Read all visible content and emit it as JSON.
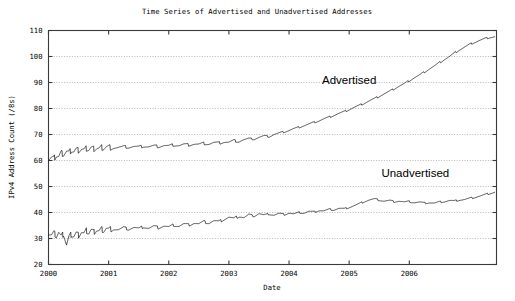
{
  "chart_data": {
    "type": "line",
    "title": "Time Series of Advertised and Unadvertised Addresses",
    "xlabel": "Date",
    "ylabel": "IPv4 Address Count (/8s)",
    "xlim": [
      2000.0,
      2007.45
    ],
    "ylim": [
      20,
      110
    ],
    "xticks": [
      2000,
      2001,
      2002,
      2003,
      2004,
      2005,
      2006
    ],
    "xtick_labels": [
      "2000",
      "2001",
      "2002",
      "2003",
      "2004",
      "2005",
      "2006"
    ],
    "yticks": [
      20,
      30,
      40,
      50,
      60,
      70,
      80,
      90,
      100,
      110
    ],
    "ytick_labels": [
      "20",
      "30",
      "40",
      "50",
      "60",
      "70",
      "80",
      "90",
      "100",
      "110"
    ],
    "grid": true,
    "grid_axis": "y",
    "legend": "none",
    "annotations": [
      {
        "text": "Advertised",
        "x": 2005.0,
        "y": 89.5
      },
      {
        "text": "Unadvertised",
        "x": 2006.1,
        "y": 53.5
      }
    ],
    "series": [
      {
        "name": "Advertised",
        "x": [
          2000.0,
          2000.05,
          2000.09,
          2000.13,
          2000.17,
          2000.21,
          2000.25,
          2000.3,
          2000.34,
          2000.38,
          2000.42,
          2000.46,
          2000.5,
          2000.55,
          2000.59,
          2000.63,
          2000.67,
          2000.71,
          2000.75,
          2000.8,
          2000.84,
          2000.88,
          2000.92,
          2000.96,
          2001.0,
          2001.08,
          2001.17,
          2001.25,
          2001.33,
          2001.42,
          2001.5,
          2001.58,
          2001.67,
          2001.75,
          2001.83,
          2001.92,
          2002.0,
          2002.08,
          2002.17,
          2002.25,
          2002.33,
          2002.42,
          2002.5,
          2002.58,
          2002.67,
          2002.75,
          2002.83,
          2002.92,
          2003.0,
          2003.08,
          2003.17,
          2003.25,
          2003.33,
          2003.42,
          2003.5,
          2003.58,
          2003.67,
          2003.75,
          2003.83,
          2003.92,
          2004.0,
          2004.08,
          2004.17,
          2004.25,
          2004.33,
          2004.42,
          2004.5,
          2004.58,
          2004.67,
          2004.75,
          2004.83,
          2004.92,
          2005.0,
          2005.08,
          2005.17,
          2005.25,
          2005.33,
          2005.42,
          2005.5,
          2005.58,
          2005.67,
          2005.75,
          2005.83,
          2005.92,
          2006.0,
          2006.08,
          2006.17,
          2006.25,
          2006.33,
          2006.42,
          2006.5,
          2006.58,
          2006.67,
          2006.75,
          2006.83,
          2006.92,
          2007.0,
          2007.08,
          2007.17,
          2007.25,
          2007.33,
          2007.42
        ],
        "y": [
          60.5,
          61.2,
          60.8,
          62.0,
          61.5,
          63.0,
          62.4,
          63.6,
          63.0,
          64.0,
          63.4,
          64.2,
          63.8,
          64.5,
          64.0,
          64.6,
          64.2,
          64.8,
          64.4,
          64.9,
          64.5,
          65.0,
          64.7,
          65.1,
          64.9,
          65.2,
          65.0,
          65.3,
          65.1,
          65.4,
          65.2,
          65.5,
          65.3,
          65.6,
          65.4,
          65.8,
          65.6,
          66.0,
          65.8,
          66.2,
          66.0,
          66.4,
          66.2,
          66.6,
          66.4,
          66.9,
          66.7,
          67.2,
          67.0,
          67.6,
          67.4,
          68.0,
          68.4,
          68.2,
          68.9,
          69.4,
          69.2,
          70.0,
          70.5,
          71.0,
          71.6,
          72.2,
          72.8,
          73.4,
          74.0,
          74.7,
          75.3,
          76.0,
          76.7,
          77.4,
          78.1,
          78.8,
          79.6,
          80.4,
          81.2,
          82.0,
          82.9,
          83.8,
          84.7,
          85.6,
          86.6,
          87.6,
          88.6,
          89.6,
          90.7,
          91.8,
          92.9,
          94.0,
          95.2,
          96.4,
          97.6,
          98.8,
          100.0,
          101.3,
          102.5,
          103.6,
          104.6,
          105.4,
          106.2,
          106.8,
          107.3,
          107.6
        ]
      },
      {
        "name": "Unadvertised",
        "x": [
          2000.0,
          2000.05,
          2000.09,
          2000.13,
          2000.17,
          2000.21,
          2000.25,
          2000.3,
          2000.34,
          2000.38,
          2000.42,
          2000.46,
          2000.5,
          2000.55,
          2000.59,
          2000.63,
          2000.67,
          2000.71,
          2000.75,
          2000.8,
          2000.84,
          2000.88,
          2000.92,
          2000.96,
          2001.0,
          2001.08,
          2001.17,
          2001.25,
          2001.33,
          2001.42,
          2001.5,
          2001.58,
          2001.67,
          2001.75,
          2001.83,
          2001.92,
          2002.0,
          2002.08,
          2002.17,
          2002.25,
          2002.33,
          2002.42,
          2002.5,
          2002.58,
          2002.67,
          2002.75,
          2002.83,
          2002.92,
          2003.0,
          2003.08,
          2003.17,
          2003.25,
          2003.33,
          2003.42,
          2003.5,
          2003.58,
          2003.67,
          2003.75,
          2003.83,
          2003.92,
          2004.0,
          2004.08,
          2004.17,
          2004.25,
          2004.33,
          2004.42,
          2004.5,
          2004.58,
          2004.67,
          2004.75,
          2004.83,
          2004.92,
          2005.0,
          2005.08,
          2005.17,
          2005.25,
          2005.33,
          2005.42,
          2005.5,
          2005.58,
          2005.67,
          2005.75,
          2005.83,
          2005.92,
          2006.0,
          2006.08,
          2006.17,
          2006.25,
          2006.33,
          2006.42,
          2006.5,
          2006.58,
          2006.67,
          2006.75,
          2006.83,
          2006.92,
          2007.0,
          2007.08,
          2007.17,
          2007.25,
          2007.33,
          2007.42
        ],
        "y": [
          32.0,
          31.4,
          32.2,
          31.0,
          32.4,
          30.6,
          31.8,
          27.6,
          30.4,
          31.6,
          30.8,
          32.0,
          31.2,
          32.6,
          31.8,
          33.0,
          32.2,
          33.2,
          32.4,
          33.4,
          32.8,
          33.6,
          33.0,
          33.8,
          33.2,
          34.0,
          33.4,
          34.2,
          33.6,
          34.3,
          33.8,
          34.5,
          34.0,
          34.7,
          34.2,
          34.9,
          34.4,
          35.2,
          34.8,
          35.6,
          35.2,
          36.0,
          35.6,
          36.4,
          36.0,
          36.8,
          36.4,
          37.4,
          38.2,
          37.6,
          38.6,
          38.0,
          39.2,
          38.6,
          39.6,
          39.0,
          39.4,
          39.0,
          39.6,
          39.2,
          39.8,
          39.4,
          40.0,
          39.8,
          40.4,
          40.2,
          40.8,
          40.6,
          41.2,
          41.0,
          41.6,
          41.4,
          42.0,
          42.6,
          43.4,
          44.2,
          44.8,
          45.2,
          44.8,
          44.4,
          44.6,
          44.2,
          44.4,
          44.0,
          44.2,
          43.8,
          44.0,
          43.6,
          43.8,
          43.6,
          44.0,
          44.2,
          44.6,
          44.4,
          44.8,
          45.0,
          45.4,
          45.8,
          46.3,
          46.8,
          47.3,
          47.8
        ]
      }
    ]
  }
}
